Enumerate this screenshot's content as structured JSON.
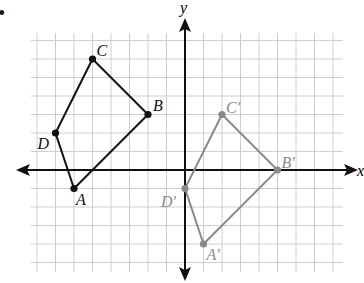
{
  "figure": {
    "bullet": "•",
    "axes": {
      "x_label": "x",
      "y_label": "y"
    },
    "grid": {
      "x_min": -8,
      "x_max": 8,
      "y_min": -5,
      "y_max": 7,
      "unit_px": 18.5,
      "origin_px": [
        185,
        170
      ]
    },
    "colors": {
      "original": "#111111",
      "image": "#8a8a8a",
      "grid": "#c8c8c8",
      "axis": "#111111"
    },
    "original_polygon": {
      "name": "ABCD",
      "vertices": [
        {
          "label": "A",
          "x": -6,
          "y": -1
        },
        {
          "label": "B",
          "x": -2,
          "y": 3
        },
        {
          "label": "C",
          "x": -5,
          "y": 6
        },
        {
          "label": "D",
          "x": -7,
          "y": 2
        }
      ]
    },
    "image_polygon": {
      "name": "A'B'C'D'",
      "vertices": [
        {
          "label": "A'",
          "x": 1,
          "y": -4
        },
        {
          "label": "B'",
          "x": 5,
          "y": 0
        },
        {
          "label": "C'",
          "x": 2,
          "y": 3
        },
        {
          "label": "D'",
          "x": 0,
          "y": -1
        }
      ]
    }
  },
  "chart_data": {
    "type": "scatter",
    "title": "",
    "xlabel": "x",
    "ylabel": "y",
    "grid": true,
    "series": [
      {
        "name": "ABCD",
        "points": [
          [
            -6,
            -1
          ],
          [
            -2,
            3
          ],
          [
            -5,
            6
          ],
          [
            -7,
            2
          ]
        ],
        "labels": [
          "A",
          "B",
          "C",
          "D"
        ],
        "closed": true,
        "color": "#111111"
      },
      {
        "name": "A'B'C'D'",
        "points": [
          [
            1,
            -4
          ],
          [
            5,
            0
          ],
          [
            2,
            3
          ],
          [
            0,
            -1
          ]
        ],
        "labels": [
          "A'",
          "B'",
          "C'",
          "D'"
        ],
        "closed": true,
        "color": "#8a8a8a"
      }
    ]
  }
}
